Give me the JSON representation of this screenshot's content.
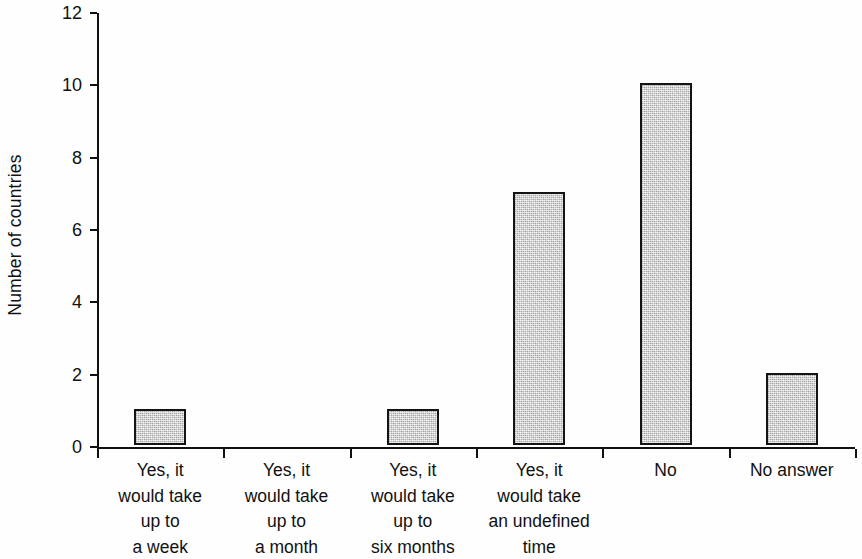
{
  "chart_data": {
    "type": "bar",
    "title": "",
    "subtitle": "",
    "xlabel": "",
    "ylabel": "Number of countries",
    "ylim": [
      0,
      12
    ],
    "ytick_labels": [
      "0",
      "2",
      "4",
      "6",
      "8",
      "10",
      "12"
    ],
    "ytick_values": [
      0,
      2,
      4,
      6,
      8,
      10,
      12
    ],
    "grid": false,
    "legend": null,
    "bar_fill_color": "#c9c9c9",
    "bar_edge_color": "#141414",
    "background_color": "#ffffff",
    "categories": [
      "Yes, it would take up to a week",
      "Yes, it would take up to a month",
      "Yes, it would take up to six months",
      "Yes, it would take an undefined time",
      "No",
      "No answer"
    ],
    "category_label_lines": [
      [
        "Yes, it",
        "would take",
        "up to",
        "a week"
      ],
      [
        "Yes, it",
        "would take",
        "up to",
        "a month"
      ],
      [
        "Yes, it",
        "would take",
        "up to",
        "six months"
      ],
      [
        "Yes, it",
        "would take",
        "an undefined",
        "time"
      ],
      [
        "No"
      ],
      [
        "No answer"
      ]
    ],
    "values": [
      1,
      0,
      1,
      7,
      10,
      2
    ]
  }
}
